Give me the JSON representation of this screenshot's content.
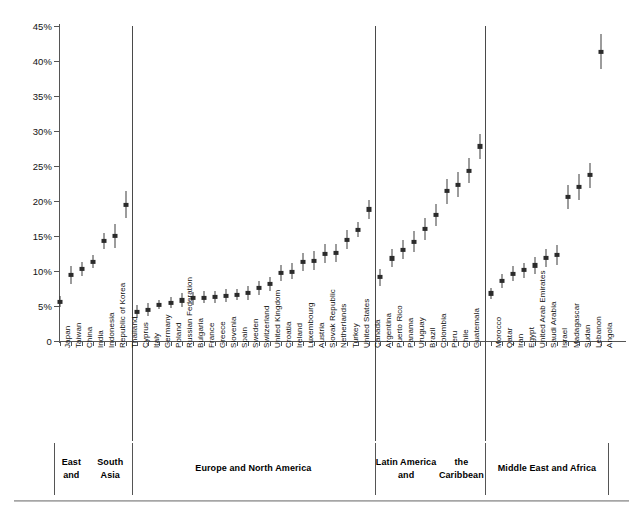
{
  "chart_data": {
    "type": "scatter",
    "title": "",
    "xlabel": "",
    "ylabel": "",
    "ylim": [
      0,
      45
    ],
    "grid": false,
    "legend": null,
    "y_tick_labels": [
      "0",
      "5%",
      "10%",
      "15%",
      "20%",
      "25%",
      "30%",
      "35%",
      "40%",
      "45%"
    ],
    "y_tick_values": [
      0,
      5,
      10,
      15,
      20,
      25,
      30,
      35,
      40,
      45
    ],
    "marker_note": "point estimate with vertical confidence interval",
    "groups": [
      {
        "name": "East and South Asia",
        "label_lines": [
          "East and",
          "South Asia"
        ],
        "points": [
          {
            "category": "Japan",
            "value": 5.6,
            "low": 4.8,
            "high": 6.4
          },
          {
            "category": "Taiwan",
            "value": 9.4,
            "low": 8.2,
            "high": 10.7
          },
          {
            "category": "China",
            "value": 10.3,
            "low": 9.3,
            "high": 11.3
          },
          {
            "category": "India",
            "value": 11.3,
            "low": 10.4,
            "high": 12.3
          },
          {
            "category": "Indonesia",
            "value": 14.3,
            "low": 13.2,
            "high": 15.4
          },
          {
            "category": "Republic of Korea",
            "value": 15.0,
            "low": 13.3,
            "high": 16.7
          },
          {
            "category": "Thailand",
            "value": 19.5,
            "low": 17.6,
            "high": 21.4
          }
        ]
      },
      {
        "name": "Europe and North America",
        "label_lines": [
          "Europe and North America"
        ],
        "points": [
          {
            "category": "Cyprus",
            "value": 4.2,
            "low": 3.3,
            "high": 5.1
          },
          {
            "category": "Italy",
            "value": 4.4,
            "low": 3.5,
            "high": 5.4
          },
          {
            "category": "Germany",
            "value": 5.2,
            "low": 4.5,
            "high": 5.9
          },
          {
            "category": "Poland",
            "value": 5.5,
            "low": 4.7,
            "high": 6.3
          },
          {
            "category": "Russian Federation",
            "value": 5.8,
            "low": 4.8,
            "high": 6.8
          },
          {
            "category": "Bulgaria",
            "value": 6.1,
            "low": 5.2,
            "high": 7.0
          },
          {
            "category": "France",
            "value": 6.2,
            "low": 5.4,
            "high": 7.1
          },
          {
            "category": "Greece",
            "value": 6.3,
            "low": 5.4,
            "high": 7.2
          },
          {
            "category": "Slovenia",
            "value": 6.5,
            "low": 5.6,
            "high": 7.4
          },
          {
            "category": "Spain",
            "value": 6.6,
            "low": 5.8,
            "high": 7.5
          },
          {
            "category": "Sweden",
            "value": 6.9,
            "low": 5.9,
            "high": 7.9
          },
          {
            "category": "Switzerland",
            "value": 7.6,
            "low": 6.6,
            "high": 8.6
          },
          {
            "category": "United Kingdom",
            "value": 8.1,
            "low": 7.1,
            "high": 9.1
          },
          {
            "category": "Croatia",
            "value": 9.7,
            "low": 8.6,
            "high": 10.8
          },
          {
            "category": "Ireland",
            "value": 9.9,
            "low": 8.8,
            "high": 11.1
          },
          {
            "category": "Luxembourg",
            "value": 11.3,
            "low": 10.0,
            "high": 12.6
          },
          {
            "category": "Austria",
            "value": 11.5,
            "low": 10.1,
            "high": 12.9
          },
          {
            "category": "Slovak Republic",
            "value": 12.4,
            "low": 11.1,
            "high": 13.8
          },
          {
            "category": "Netherlands",
            "value": 12.6,
            "low": 11.3,
            "high": 13.9
          },
          {
            "category": "Turkey",
            "value": 14.5,
            "low": 13.2,
            "high": 15.9
          },
          {
            "category": "United States",
            "value": 15.9,
            "low": 14.8,
            "high": 17.0
          },
          {
            "category": "Canada",
            "value": 18.8,
            "low": 17.4,
            "high": 20.2
          }
        ]
      },
      {
        "name": "Latin America and the Caribbean",
        "label_lines": [
          "Latin America and",
          "the Caribbean"
        ],
        "points": [
          {
            "category": "Argentina",
            "value": 9.1,
            "low": 7.9,
            "high": 10.3
          },
          {
            "category": "Puerto Rico",
            "value": 11.8,
            "low": 10.5,
            "high": 13.1
          },
          {
            "category": "Panama",
            "value": 13.0,
            "low": 11.7,
            "high": 14.4
          },
          {
            "category": "Uruguay",
            "value": 14.2,
            "low": 12.7,
            "high": 15.7
          },
          {
            "category": "Brazil",
            "value": 16.0,
            "low": 14.4,
            "high": 17.6
          },
          {
            "category": "Colombia",
            "value": 18.0,
            "low": 16.4,
            "high": 19.6
          },
          {
            "category": "Peru",
            "value": 21.4,
            "low": 19.6,
            "high": 23.2
          },
          {
            "category": "Chile",
            "value": 22.3,
            "low": 20.5,
            "high": 24.1
          },
          {
            "category": "Guatemala",
            "value": 24.3,
            "low": 22.6,
            "high": 26.1
          },
          {
            "category": "Guatemala2",
            "value": 27.8,
            "low": 26.0,
            "high": 29.6
          }
        ]
      },
      {
        "name": "Middle East and Africa",
        "label_lines": [
          "Middle East and Africa"
        ],
        "points": [
          {
            "category": "Morocco",
            "value": 6.8,
            "low": 6.0,
            "high": 7.6
          },
          {
            "category": "Qatar",
            "value": 8.6,
            "low": 7.6,
            "high": 9.6
          },
          {
            "category": "Iran",
            "value": 9.6,
            "low": 8.5,
            "high": 10.7
          },
          {
            "category": "Egypt",
            "value": 10.1,
            "low": 9.0,
            "high": 11.2
          },
          {
            "category": "United Arab Emirates",
            "value": 10.8,
            "low": 9.6,
            "high": 12.0
          },
          {
            "category": "Saudi Arabia",
            "value": 11.9,
            "low": 10.6,
            "high": 13.2
          },
          {
            "category": "Israel",
            "value": 12.3,
            "low": 10.9,
            "high": 13.7
          },
          {
            "category": "Madagascar",
            "value": 20.6,
            "low": 18.9,
            "high": 22.3
          },
          {
            "category": "Sudan",
            "value": 22.0,
            "low": 20.2,
            "high": 23.8
          },
          {
            "category": "Lebanon",
            "value": 23.7,
            "low": 21.9,
            "high": 25.5
          },
          {
            "category": "Angola",
            "value": 41.3,
            "low": 38.8,
            "high": 43.8
          }
        ]
      }
    ]
  }
}
